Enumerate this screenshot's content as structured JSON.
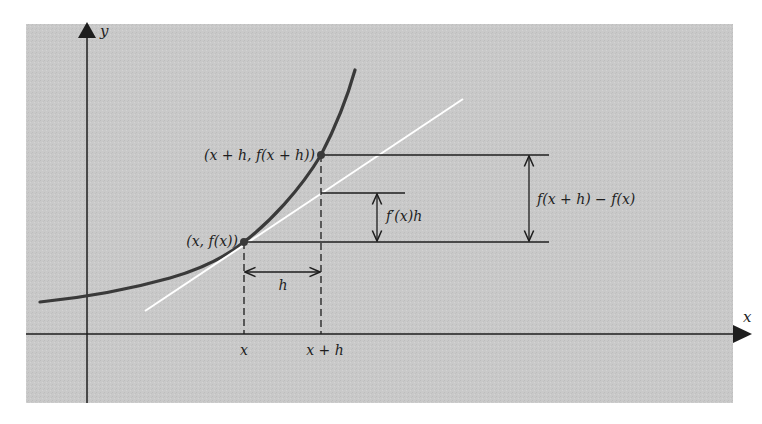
{
  "figure": {
    "type": "derivative-approximation-diagram",
    "colors": {
      "page_background": "#ffffff",
      "panel_background": "#c9c9c9",
      "ink": "#1e1e1e",
      "curve": "#3a3a3a",
      "tangent_line": "#ffffff"
    },
    "axes": {
      "x_label": "x",
      "y_label": "y"
    },
    "points": {
      "p1_label": "(x, f(x))",
      "p2_label": "(x + h, f(x + h))"
    },
    "tick_labels": {
      "x": "x",
      "x_plus_h": "x + h"
    },
    "dimensions": {
      "h_label": "h",
      "tangent_rise_label": "f′(x)h",
      "secant_rise_label": "f(x + h) − f(x)"
    }
  }
}
